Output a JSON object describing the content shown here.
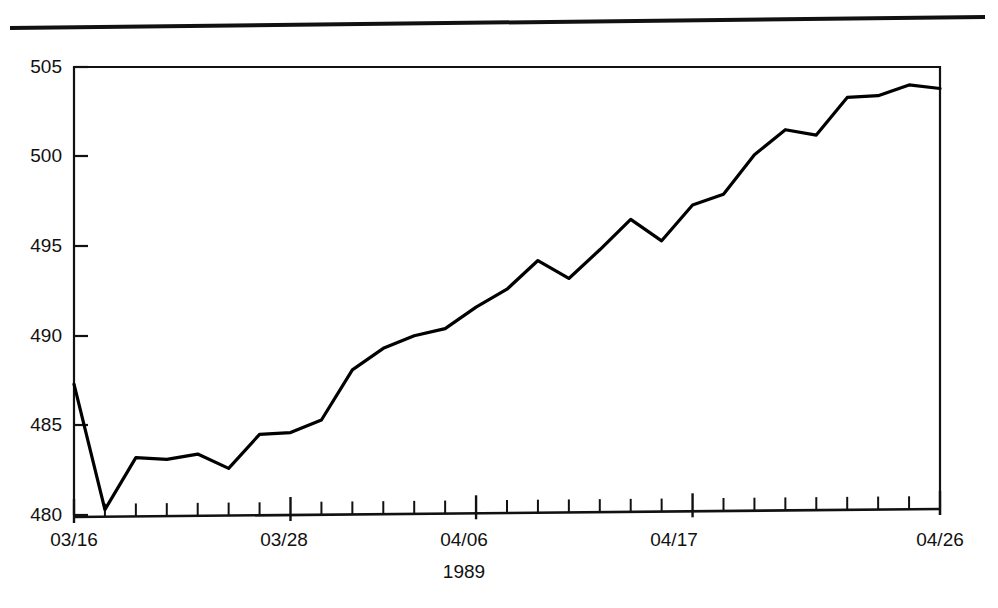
{
  "page": {
    "rule_present": true
  },
  "chart_data": {
    "type": "line",
    "title": "",
    "subtitle": "",
    "xlabel": "1989",
    "ylabel": "",
    "ylim": [
      480,
      505
    ],
    "yticks": [
      480,
      485,
      490,
      495,
      500,
      505
    ],
    "ytick_labels": [
      "480",
      "485",
      "490",
      "495",
      "500",
      "505"
    ],
    "xtick_labels": [
      "03/16",
      "03/28",
      "04/06",
      "04/17",
      "04/26"
    ],
    "xtick_label_positions": [
      0,
      7,
      13,
      20,
      28
    ],
    "minor_tick_count": 29,
    "grid": false,
    "legend": null,
    "line_color": "#000000",
    "line_width": 3.2,
    "frame_color": "#000000",
    "x": [
      "03/16",
      "03/17",
      "03/20",
      "03/21",
      "03/22",
      "03/23",
      "03/24",
      "03/28",
      "03/29",
      "03/30",
      "03/31",
      "04/03",
      "04/04",
      "04/05",
      "04/06",
      "04/07",
      "04/10",
      "04/11",
      "04/12",
      "04/13",
      "04/14",
      "04/17",
      "04/18",
      "04/19",
      "04/20",
      "04/21",
      "04/24",
      "04/25",
      "04/26"
    ],
    "values": [
      487.3,
      480.3,
      483.2,
      483.1,
      483.4,
      482.6,
      484.5,
      484.6,
      485.3,
      488.1,
      489.3,
      490.0,
      490.4,
      491.6,
      492.6,
      494.2,
      493.2,
      494.8,
      496.5,
      495.3,
      497.3,
      497.9,
      500.1,
      501.5,
      501.2,
      503.3,
      503.4,
      504.0,
      503.8
    ],
    "axis_pixel_geometry": {
      "plot_left": 74,
      "plot_right": 940,
      "plot_top": 67,
      "plot_bottom": 515
    }
  }
}
